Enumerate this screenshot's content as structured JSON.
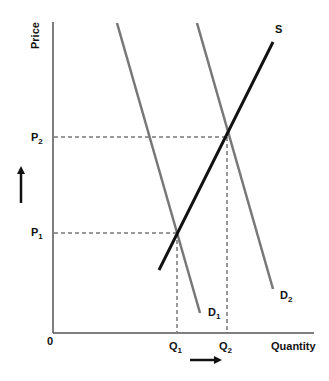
{
  "diagram": {
    "type": "supply-demand",
    "axes": {
      "y_label": "Price",
      "x_label": "Quantity",
      "origin_label": "0"
    },
    "price_levels": [
      {
        "label": "P",
        "sub": "1"
      },
      {
        "label": "P",
        "sub": "2"
      }
    ],
    "quantity_levels": [
      {
        "label": "Q",
        "sub": "1"
      },
      {
        "label": "Q",
        "sub": "2"
      }
    ],
    "curves": {
      "supply": {
        "label": "S"
      },
      "demand1": {
        "label": "D",
        "sub": "1"
      },
      "demand2": {
        "label": "D",
        "sub": "2"
      }
    },
    "colors": {
      "axis": "#555555",
      "demand": "#777777",
      "supply": "#111111",
      "dashed": "#333333"
    }
  }
}
